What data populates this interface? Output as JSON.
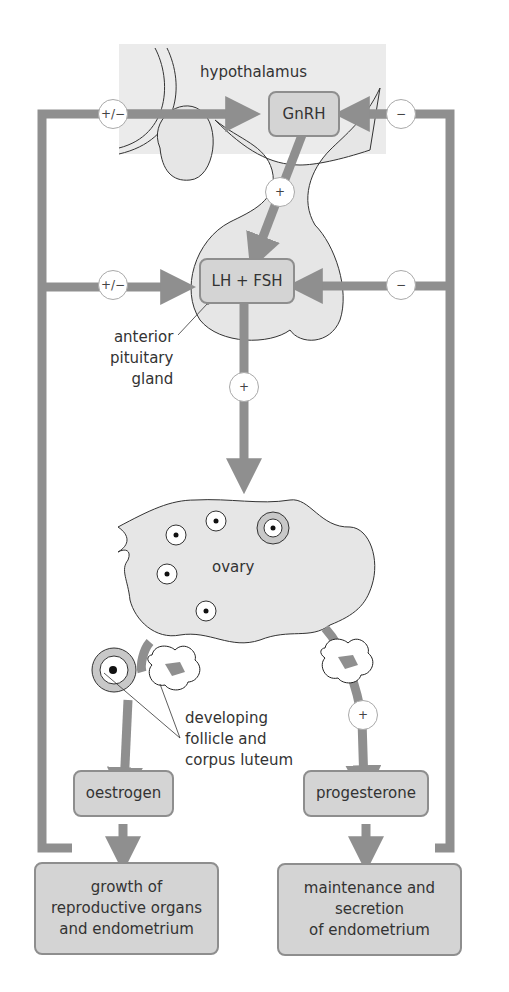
{
  "diagram": {
    "regions": {
      "hypothalamus": "hypothalamus",
      "pituitary": "anterior\npituitary\ngland",
      "ovary": "ovary",
      "follicle_label": "developing\nfollicle and\ncorpus luteum"
    },
    "hormones": {
      "gnrh": "GnRH",
      "lh_fsh": "LH + FSH",
      "oestrogen": "oestrogen",
      "progesterone": "progesterone"
    },
    "effects": {
      "oestrogen_effect": "growth of\nreproductive organs\nand endometrium",
      "progesterone_effect": "maintenance and\nsecretion\nof endometrium"
    },
    "signs": {
      "oestrogen_to_gnrh": "+/−",
      "progesterone_to_gnrh": "−",
      "gnrh_to_pituitary": "+",
      "oestrogen_to_lhfsh": "+/−",
      "progesterone_to_lhfsh": "−",
      "lhfsh_to_ovary": "+",
      "corpus_luteum_to_progesterone": "+"
    },
    "colors": {
      "arrow": "#8f8f8f",
      "box_fill": "#d4d4d4",
      "box_border": "#8e8e8e",
      "tissue_fill": "#e6e6e6",
      "background": "#ffffff"
    }
  }
}
